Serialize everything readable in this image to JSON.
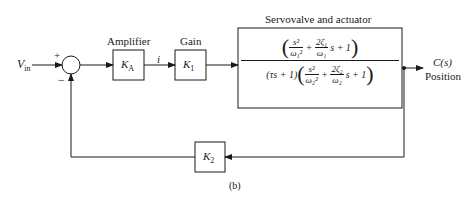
{
  "diagram": {
    "input": {
      "symbol": "V",
      "subscript": "in"
    },
    "summing_junction": {
      "plus_sign": "+",
      "minus_sign": "−"
    },
    "blocks": {
      "amplifier": {
        "title": "Amplifier",
        "symbol": "K",
        "subscript": "A"
      },
      "gain": {
        "title": "Gain",
        "symbol": "K",
        "subscript": "1"
      },
      "servo": {
        "title": "Servovalve and actuator",
        "numerator": {
          "term1_num": "s²",
          "term1_den": "ω₁²",
          "plus1": "+",
          "term2_num": "2ζ₁",
          "term2_den": "ω₁",
          "tail": "s + 1"
        },
        "denominator": {
          "lead": "(τs + 1)",
          "term1_num": "s²",
          "term1_den": "ω₂²",
          "plus1": "+",
          "term2_num": "2ζ₂",
          "term2_den": "ω₂",
          "tail": "s + 1"
        }
      },
      "feedback": {
        "symbol": "K",
        "subscript": "2"
      }
    },
    "signal_between_amp_gain": "i",
    "output": {
      "symbol": "C(s)",
      "label": "Position"
    },
    "caption": "(b)"
  }
}
